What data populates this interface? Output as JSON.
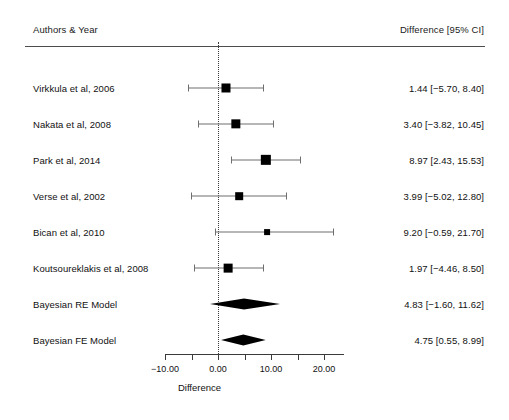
{
  "header": {
    "authors_label": "Authors & Year",
    "ci_label": "Difference [95% CI]"
  },
  "axis": {
    "title": "Difference",
    "tick_labels": [
      "-10.00",
      "0.00",
      "10.00",
      "20.00"
    ]
  },
  "chart_data": {
    "type": "forest",
    "title": "",
    "xlabel": "Difference",
    "ylabel": "",
    "xlim": [
      -11.5,
      23.5
    ],
    "ticks": [
      -10,
      0,
      10,
      20
    ],
    "minor_ticks": [
      -5,
      5,
      15
    ],
    "reference_line": 0,
    "grid": false,
    "legend": "none",
    "columns": [
      "Authors & Year",
      "Difference [95% CI]"
    ],
    "rows": [
      {
        "label": "Virkkula et al, 2006",
        "estimate": 1.44,
        "ci_low": -5.7,
        "ci_high": 8.4,
        "text": "1.44 [−5.70, 8.40]",
        "weight": 0.72,
        "type": "study"
      },
      {
        "label": "Nakata et al, 2008",
        "estimate": 3.4,
        "ci_low": -3.82,
        "ci_high": 10.45,
        "text": "3.40 [−3.82, 10.45]",
        "weight": 0.76,
        "type": "study"
      },
      {
        "label": "Park et al, 2014",
        "estimate": 8.97,
        "ci_low": 2.43,
        "ci_high": 15.53,
        "text": "8.97 [2.43, 15.53]",
        "weight": 0.9,
        "type": "study"
      },
      {
        "label": "Verse et al, 2002",
        "estimate": 3.99,
        "ci_low": -5.02,
        "ci_high": 12.8,
        "text": "3.99 [−5.02, 12.80]",
        "weight": 0.52,
        "type": "study"
      },
      {
        "label": "Bican et al, 2010",
        "estimate": 9.2,
        "ci_low": -0.59,
        "ci_high": 21.7,
        "text": "9.20 [−0.59, 21.70]",
        "weight": 0.26,
        "type": "study"
      },
      {
        "label": "Koutsoureklakis et al, 2008",
        "estimate": 1.97,
        "ci_low": -4.46,
        "ci_high": 8.5,
        "text": "1.97 [−4.46, 8.50]",
        "weight": 0.68,
        "type": "study"
      },
      {
        "label": "Bayesian RE Model",
        "estimate": 4.83,
        "ci_low": -1.6,
        "ci_high": 11.62,
        "text": "4.83 [−1.60, 11.62]",
        "weight": 1.0,
        "type": "summary"
      },
      {
        "label": "Bayesian FE Model",
        "estimate": 4.75,
        "ci_low": 0.55,
        "ci_high": 8.99,
        "text": "4.75 [0.55, 8.99]",
        "weight": 1.0,
        "type": "summary"
      }
    ]
  },
  "colors": {
    "marker": "#000000",
    "ci_line": "#6f6f6f",
    "rule": "#4d4d4d",
    "text": "#111111"
  }
}
